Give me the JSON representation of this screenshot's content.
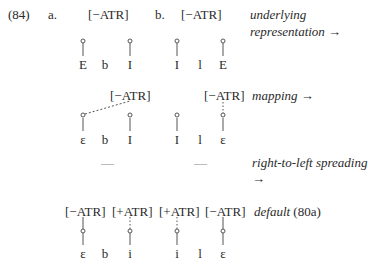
{
  "example": {
    "number": "(84)",
    "labels": {
      "a": "a.",
      "b": "b."
    },
    "rows": [
      {
        "id": "underlying",
        "annotation_line1": "underlying",
        "annotation_line2": "representation →",
        "features_a": [
          "[−ATR]"
        ],
        "features_b": [
          "[−ATR]"
        ],
        "segments_a": [
          "E",
          "b",
          "I"
        ],
        "segments_b": [
          "I",
          "l",
          "E"
        ]
      },
      {
        "id": "mapping",
        "annotation": "mapping →",
        "features_a": [
          "[−ATR]"
        ],
        "features_b": [
          "[−ATR]"
        ],
        "segments_a": [
          "ε",
          "b",
          "I"
        ],
        "segments_b": [
          "I",
          "l",
          "ε"
        ]
      },
      {
        "id": "spreading",
        "annotation_line1": "right-to-left spreading",
        "annotation_line2": "→",
        "placeholder_a": "—",
        "placeholder_b": "—"
      },
      {
        "id": "default",
        "annotation_italic": "default",
        "annotation_ref": "(80a)",
        "features": [
          "[−ATR]",
          "[+ATR]",
          "[+ATR]",
          "[−ATR]"
        ],
        "segments_a": [
          "ε",
          "b",
          "i"
        ],
        "segments_b": [
          "i",
          "l",
          "ε"
        ]
      }
    ]
  }
}
